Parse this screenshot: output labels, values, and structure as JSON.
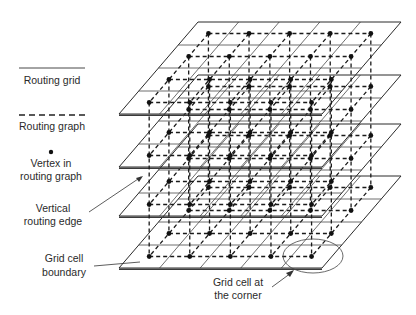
{
  "legend": {
    "routing_grid": "Routing grid",
    "routing_graph": "Routing graph",
    "vertex_line1": "Vertex in",
    "vertex_line2": "routing graph",
    "vertical_line1": "Vertical",
    "vertical_line2": "routing edge",
    "boundary_line1": "Grid cell",
    "boundary_line2": "boundary"
  },
  "callout": {
    "corner_line1": "Grid cell at",
    "corner_line2": "the corner"
  },
  "structure": {
    "layers": 4,
    "columns": 5,
    "rows": 4,
    "plane_top_y": [
      22,
      75,
      124,
      176
    ],
    "plane_height": 92,
    "plane_top_left_x": 198,
    "plane_top_right_x": 401,
    "plane_bottom_left_x": 119
  },
  "colors": {
    "line": "#2a2a2a",
    "vertex": "#111111",
    "background": "#ffffff"
  }
}
